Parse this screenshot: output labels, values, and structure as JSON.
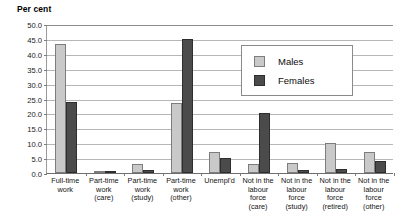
{
  "chart_data": {
    "type": "bar",
    "title": "",
    "xlabel": "",
    "ylabel": "Per cent",
    "ylim": [
      0,
      50
    ],
    "ytick_step": 5,
    "grid": true,
    "legend_position": "inside-upper-right",
    "ytick_labels": [
      "50.0",
      "45.0",
      "40.0",
      "35.0",
      "30.0",
      "25.0",
      "20.0",
      "15.0",
      "10.0",
      "5.0",
      "0.0"
    ],
    "categories": [
      "Full-time work",
      "Part-time work (care)",
      "Part-time work (study)",
      "Part-time work (other)",
      "Unempl'd",
      "Not in the labour force (care)",
      "Not in the labour force (study)",
      "Not in the labour force (retired)",
      "Not in the labour force (other)"
    ],
    "category_label_lines": [
      [
        "Full-time",
        "work"
      ],
      [
        "Part-time",
        "work",
        "(care)"
      ],
      [
        "Part-time",
        "work",
        "(study)"
      ],
      [
        "Part-time",
        "work",
        "(other)"
      ],
      [
        "Unempl'd"
      ],
      [
        "Not in the",
        "labour",
        "force",
        "(care)"
      ],
      [
        "Not in the",
        "labour",
        "force",
        "(study)"
      ],
      [
        "Not in the",
        "labour",
        "force",
        "(retired)"
      ],
      [
        "Not in the",
        "labour",
        "force",
        "(other)"
      ]
    ],
    "series": [
      {
        "name": "Males",
        "color": "#c9c9c9",
        "values": [
          43.3,
          0.3,
          3.0,
          23.5,
          7.0,
          3.0,
          3.5,
          10.0,
          7.0
        ]
      },
      {
        "name": "Females",
        "color": "#4b4b4b",
        "values": [
          23.8,
          0.4,
          1.0,
          45.0,
          5.0,
          20.2,
          1.0,
          1.2,
          4.0
        ]
      }
    ]
  },
  "legend": {
    "items": [
      {
        "label": "Males"
      },
      {
        "label": "Females"
      }
    ]
  }
}
